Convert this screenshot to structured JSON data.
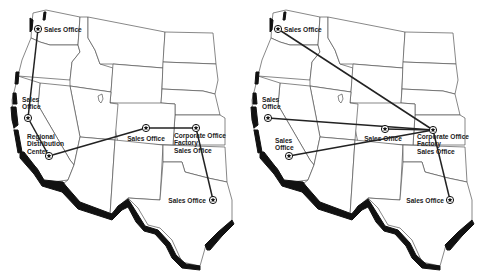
{
  "colors": {
    "route": "#222222",
    "state_border": "#555555",
    "coastline": "#111111",
    "background": "#ffffff"
  },
  "maps": [
    {
      "id": "left",
      "nodes": [
        {
          "key": "seattle",
          "label_lines": [
            "Sales Office"
          ],
          "x": 38,
          "y": 29,
          "lx": 44,
          "ly": 31.5,
          "anchor": "start"
        },
        {
          "key": "sf",
          "label_lines": [
            "Sales",
            "Office"
          ],
          "x": 28,
          "y": 118,
          "lx": 22,
          "ly": 102,
          "anchor": "start"
        },
        {
          "key": "la",
          "label_lines": [
            "Regional",
            "Distribution",
            "Center"
          ],
          "x": 49,
          "y": 156,
          "lx": 27,
          "ly": 139,
          "anchor": "start"
        },
        {
          "key": "denver",
          "label_lines": [
            "Sales Office"
          ],
          "x": 146,
          "y": 128,
          "lx": 146,
          "ly": 141,
          "anchor": "middle"
        },
        {
          "key": "kc",
          "label_lines": [
            "Corporate Office",
            "Factory",
            "Sales Office"
          ],
          "x": 196,
          "y": 128,
          "lx": 174,
          "ly": 138,
          "anchor": "start"
        },
        {
          "key": "dallas",
          "label_lines": [
            "Sales Office"
          ],
          "x": 213,
          "y": 200,
          "lx": 206,
          "ly": 202.5,
          "anchor": "end"
        }
      ],
      "routes": [
        [
          "seattle",
          "sf"
        ],
        [
          "sf",
          "la"
        ],
        [
          "la",
          "denver"
        ],
        [
          "denver",
          "kc"
        ],
        [
          "kc",
          "dallas"
        ]
      ]
    },
    {
      "id": "right",
      "nodes": [
        {
          "key": "seattle",
          "label_lines": [
            "Sales Office"
          ],
          "x": 278,
          "y": 29,
          "lx": 284,
          "ly": 31.5,
          "anchor": "start"
        },
        {
          "key": "sf",
          "label_lines": [
            "Sales",
            "Office"
          ],
          "x": 268,
          "y": 118,
          "lx": 262,
          "ly": 102,
          "anchor": "start"
        },
        {
          "key": "la",
          "label_lines": [
            "Sales",
            "Office"
          ],
          "x": 289,
          "y": 156,
          "lx": 275,
          "ly": 143,
          "anchor": "start"
        },
        {
          "key": "denver",
          "label_lines": [
            "Sales Office"
          ],
          "x": 385,
          "y": 129,
          "lx": 383,
          "ly": 141,
          "anchor": "middle"
        },
        {
          "key": "kc",
          "label_lines": [
            "Corporate Office",
            "Factory",
            "Sales Office"
          ],
          "x": 433,
          "y": 130,
          "lx": 417,
          "ly": 139,
          "anchor": "start"
        },
        {
          "key": "dallas",
          "label_lines": [
            "Sales Office"
          ],
          "x": 450,
          "y": 200,
          "lx": 444,
          "ly": 202.5,
          "anchor": "end"
        }
      ],
      "routes": [
        [
          "kc",
          "seattle"
        ],
        [
          "kc",
          "sf"
        ],
        [
          "kc",
          "la"
        ],
        [
          "kc",
          "denver"
        ],
        [
          "kc",
          "dallas"
        ]
      ]
    }
  ]
}
